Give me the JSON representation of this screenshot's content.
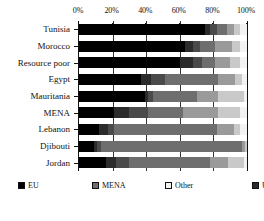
{
  "chart_data": {
    "type": "bar",
    "orientation": "horizontal",
    "stacked": true,
    "normalized": true,
    "title": "",
    "subtitle": "",
    "xlabel": "",
    "ylabel": "",
    "xlim": [
      0,
      100
    ],
    "xticks": [
      "0%",
      "20%",
      "40%",
      "60%",
      "80%",
      "100%"
    ],
    "xtick_values": [
      0,
      20,
      40,
      60,
      80,
      100
    ],
    "grid": "vertical",
    "legend_position": "bottom",
    "axis_position": "top",
    "categories": [
      "Tunisia",
      "Morocco",
      "Resource poor",
      "Egypt",
      "Mauritania",
      "MENA",
      "Lebanon",
      "Djibouti",
      "Jordan"
    ],
    "series": [
      {
        "name": "EU",
        "color": "#000000",
        "values": [
          75,
          63,
          60,
          37,
          39,
          21,
          12,
          9,
          16
        ]
      },
      {
        "name": "USA",
        "color": "#2b2b2b",
        "values": [
          3,
          5,
          8,
          6,
          2,
          9,
          5,
          2,
          6
        ]
      },
      {
        "name": "Other Advanced",
        "color": "#4a4a4a",
        "values": [
          4,
          4,
          5,
          8,
          3,
          11,
          4,
          2,
          8
        ]
      },
      {
        "name": "MENA",
        "color": "#6e6e6e",
        "values": [
          6,
          9,
          8,
          32,
          26,
          21,
          61,
          84,
          48
        ]
      },
      {
        "name": "BRICs",
        "color": "#9a9a9a",
        "values": [
          4,
          10,
          9,
          10,
          13,
          21,
          10,
          2,
          11
        ]
      },
      {
        "name": "Other emerging",
        "color": "#c9c9c9",
        "values": [
          4,
          5,
          6,
          4,
          15,
          13,
          4,
          1,
          9
        ]
      },
      {
        "name": "Other",
        "color": "#f2f2f2",
        "values": [
          4,
          4,
          4,
          3,
          2,
          4,
          4,
          0,
          2
        ]
      }
    ]
  },
  "legend": {
    "items": [
      {
        "label": "EU",
        "swatch": "c-eu"
      },
      {
        "label": "MENA",
        "swatch": "c-mena"
      },
      {
        "label": "Other",
        "swatch": "c-other"
      },
      {
        "label": "USA",
        "swatch": "c-usa"
      },
      {
        "label": "BRICs",
        "swatch": "c-brics"
      },
      {
        "label": "Other Advanced",
        "swatch": "c-other-adv"
      },
      {
        "label": "Other emerging",
        "swatch": "c-other-emerging"
      }
    ]
  }
}
